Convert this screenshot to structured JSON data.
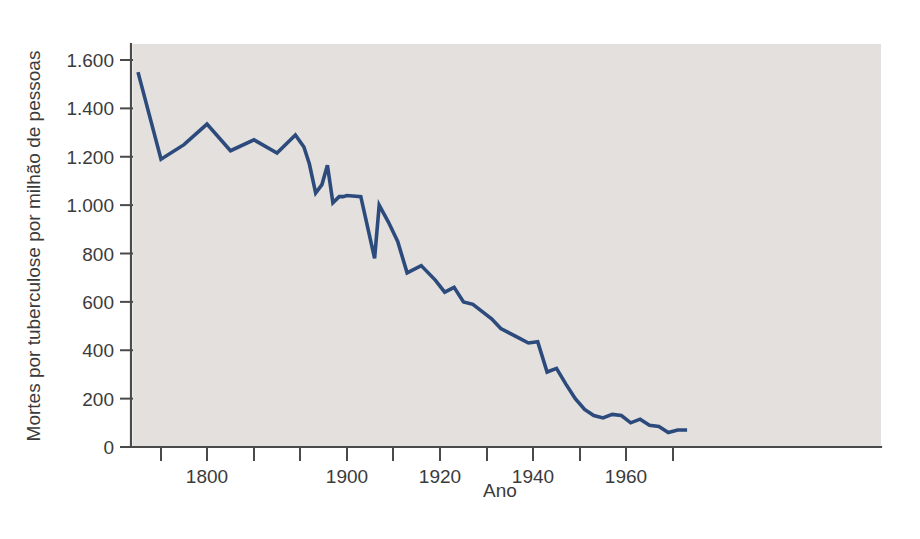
{
  "figure": {
    "background_color": "#ffffff",
    "plot_background_color": "#e3e0dd",
    "line_color": "#2c4b7c"
  },
  "chart_data": {
    "type": "line",
    "title": "",
    "subtitle": "",
    "xlabel": "Ano",
    "ylabel": "Mortes por tuberculose por milhão de pessoas",
    "xlim": [
      1770,
      1975
    ],
    "ylim": [
      0,
      1700
    ],
    "grid": false,
    "legend": null,
    "legend_position": "none",
    "x_tick_labels": [
      "",
      "1800",
      "",
      "",
      "1900",
      "",
      "1920",
      "",
      "1940",
      "",
      "1960",
      ""
    ],
    "x_tick_values": [
      1780,
      1800,
      1820,
      1840,
      1900,
      1910,
      1920,
      1930,
      1940,
      1950,
      1960,
      1970
    ],
    "y_tick_labels": [
      "0",
      "200",
      "400",
      "600",
      "800",
      "1.000",
      "1.200",
      "1.400",
      "1.600"
    ],
    "y_tick_values": [
      0,
      200,
      400,
      600,
      800,
      1000,
      1200,
      1400,
      1600
    ],
    "series": [
      {
        "name": "Mortes por tuberculose por milhão de pessoas",
        "color": "#2c4b7c",
        "x": [
          1770,
          1780,
          1790,
          1800,
          1810,
          1820,
          1830,
          1838,
          1845,
          1852,
          1860,
          1868,
          1875,
          1882,
          1890,
          1895,
          1900,
          1903,
          1906,
          1907,
          1909,
          1911,
          1913,
          1916,
          1919,
          1921,
          1923,
          1925,
          1927,
          1929,
          1931,
          1933,
          1935,
          1937,
          1939,
          1941,
          1943,
          1945,
          1947,
          1949,
          1951,
          1953,
          1955,
          1957,
          1959,
          1961,
          1963,
          1965,
          1967,
          1969,
          1971,
          1973
        ],
        "y": [
          1550,
          1190,
          1250,
          1335,
          1225,
          1270,
          1215,
          1290,
          1240,
          1170,
          1050,
          1085,
          1165,
          1010,
          1035,
          1035,
          1040,
          1035,
          780,
          1000,
          930,
          850,
          720,
          750,
          690,
          640,
          660,
          600,
          590,
          560,
          530,
          490,
          470,
          450,
          430,
          435,
          310,
          325,
          260,
          200,
          155,
          130,
          120,
          135,
          130,
          100,
          115,
          90,
          85,
          60,
          70,
          70
        ]
      }
    ]
  }
}
